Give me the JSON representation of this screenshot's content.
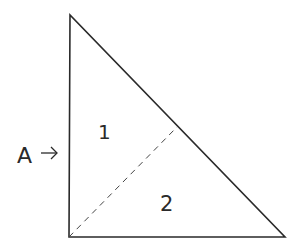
{
  "diagram": {
    "type": "right-triangle-split",
    "stroke_color": "#2a2a2a",
    "background": "#ffffff",
    "vertices": {
      "apex": [
        70,
        15
      ],
      "bottom_left": [
        69,
        237
      ],
      "bottom_right": [
        285,
        237
      ]
    },
    "dashed_line": {
      "from": [
        69,
        237
      ],
      "to": [
        177,
        127
      ]
    },
    "regions": [
      {
        "label": "1",
        "position": [
          104,
          137
        ]
      },
      {
        "label": "2",
        "position": [
          169,
          210
        ]
      }
    ],
    "pointer": {
      "label": "A",
      "arrow": "→",
      "position": [
        18,
        162
      ]
    }
  }
}
